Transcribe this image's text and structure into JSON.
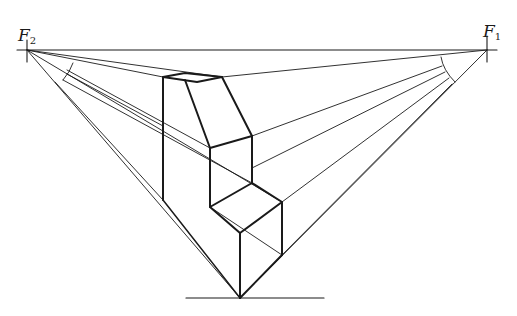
{
  "diagram": {
    "vanishing_points": [
      {
        "id": "F2",
        "letter": "F",
        "sub": "2",
        "x": 27,
        "y": 50
      },
      {
        "id": "F1",
        "letter": "F",
        "sub": "1",
        "x": 487,
        "y": 50
      }
    ],
    "stroke_color": "#1a1a1a",
    "background": "#ffffff"
  }
}
